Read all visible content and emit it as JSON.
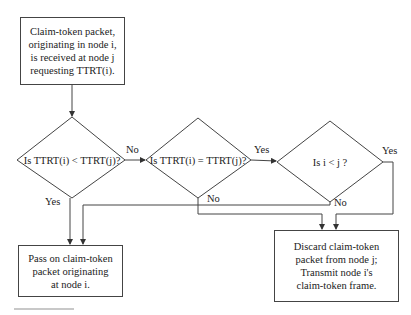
{
  "flowchart": {
    "start": {
      "lines": [
        "Claim-token packet,",
        "originating in node i,",
        "is received at node j",
        "requesting TTRT(i)."
      ]
    },
    "decisions": [
      {
        "id": "d1",
        "text": "Is TTRT(i) < TTRT(j)?"
      },
      {
        "id": "d2",
        "text": "Is TTRT(i) = TTRT(j)?"
      },
      {
        "id": "d3",
        "text": "Is i < j ?"
      }
    ],
    "outcomes": {
      "pass_on": {
        "lines": [
          "Pass on claim-token",
          "packet originating",
          "at node i."
        ]
      },
      "discard": {
        "lines": [
          "Discard claim-token",
          "packet from node j;",
          "Transmit node i's",
          "claim-token frame."
        ]
      }
    },
    "edge_labels": {
      "d1_no": "No",
      "d1_yes": "Yes",
      "d2_yes": "Yes",
      "d2_no": "No",
      "d3_yes": "Yes",
      "d3_no": "No"
    }
  },
  "colors": {
    "line": "#444444",
    "text": "#222222",
    "background": "#ffffff"
  }
}
